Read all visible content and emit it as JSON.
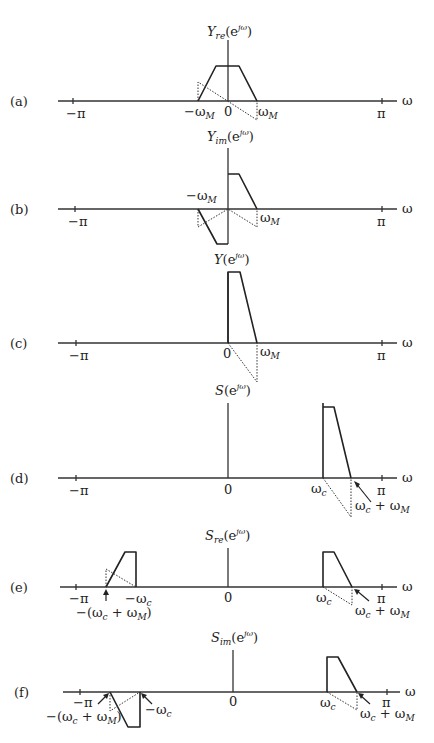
{
  "figure": {
    "axis_variable": "ω",
    "tick_neg_pi": "−π",
    "tick_pi": "π",
    "zero": "0",
    "panels": [
      {
        "id": "a",
        "panel_label": "(a)",
        "ylabel_main": "Y",
        "ylabel_sub": "re",
        "ylabel_arg_open": "(e",
        "ylabel_arg_sup": "jω",
        "ylabel_arg_close": ")",
        "tick_labels": [
          {
            "main": "−ω",
            "sub": "M"
          },
          {
            "main": "ω",
            "sub": "M"
          }
        ]
      },
      {
        "id": "b",
        "panel_label": "(b)",
        "ylabel_main": "Y",
        "ylabel_sub": "im",
        "ylabel_arg_open": "(e",
        "ylabel_arg_sup": "jω",
        "ylabel_arg_close": ")",
        "tick_labels": [
          {
            "main": "−ω",
            "sub": "M"
          },
          {
            "main": "ω",
            "sub": "M"
          }
        ]
      },
      {
        "id": "c",
        "panel_label": "(c)",
        "ylabel_main": "Y",
        "ylabel_sub": "",
        "ylabel_arg_open": "(e",
        "ylabel_arg_sup": "jω",
        "ylabel_arg_close": ")",
        "tick_labels": [
          {
            "main": "ω",
            "sub": "M"
          }
        ]
      },
      {
        "id": "d",
        "panel_label": "(d)",
        "ylabel_main": "S",
        "ylabel_sub": "",
        "ylabel_arg_open": "(e",
        "ylabel_arg_sup": "jω",
        "ylabel_arg_close": ")",
        "tick_labels": [
          {
            "main": "ω",
            "sub": "c"
          },
          {
            "main": "ω",
            "sub": "c",
            "plus": " + ω",
            "sub2": "M"
          }
        ]
      },
      {
        "id": "e",
        "panel_label": "(e)",
        "ylabel_main": "S",
        "ylabel_sub": "re",
        "ylabel_arg_open": "(e",
        "ylabel_arg_sup": "jω",
        "ylabel_arg_close": ")",
        "tick_labels": [
          {
            "main": "−(ω",
            "sub": "c",
            "plus": " + ω",
            "sub2": "M",
            "close": ")"
          },
          {
            "main": "−ω",
            "sub": "c"
          },
          {
            "main": "ω",
            "sub": "c"
          },
          {
            "main": "ω",
            "sub": "c",
            "plus": " + ω",
            "sub2": "M"
          }
        ]
      },
      {
        "id": "f",
        "panel_label": "(f)",
        "ylabel_main": "S",
        "ylabel_sub": "im",
        "ylabel_arg_open": "(e",
        "ylabel_arg_sup": "jω",
        "ylabel_arg_close": ")",
        "tick_labels": [
          {
            "main": "−(ω",
            "sub": "c",
            "plus": " + ω",
            "sub2": "M",
            "close": ")"
          },
          {
            "main": "−ω",
            "sub": "c"
          },
          {
            "main": "ω",
            "sub": "c"
          },
          {
            "main": "ω",
            "sub": "c",
            "plus": " + ω",
            "sub2": "M"
          }
        ]
      }
    ]
  }
}
